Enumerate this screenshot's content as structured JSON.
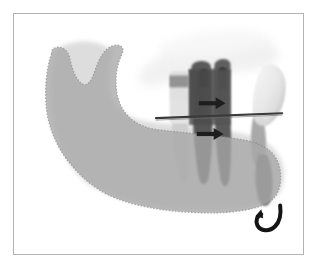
{
  "figure": {
    "caption": "",
    "frame": {
      "border_color": "#b3b3b3",
      "background_color": "#ffffff",
      "left": 13,
      "top": 13,
      "width": 291,
      "height": 242
    }
  },
  "colors": {
    "page_background": "#ffffff",
    "frame_border": "#b3b3b3",
    "mandible_overlay_fill": "#a8a8a8",
    "mandible_overlay_edge": "#8f8f8f",
    "radiograph_bone_light": "#d8d8d8",
    "radiograph_soft_tissue": "#efefef",
    "tooth_enamel_light": "#f2f2f2",
    "molar_dark": "#4a4a4a",
    "molar_mid": "#6e6e6e",
    "premolar_light": "#c9c9c9",
    "osteotomy_line": "#3a3a3a",
    "arrow_color": "#1e1e1e",
    "rotation_arrow_color": "#141414",
    "root_shadow_dark": "#5f5f5f"
  },
  "annotations": {
    "horizontal_line": {
      "name": "osteotomy-cut-line",
      "description": "Horizontal osteotomy reference line",
      "x1": 156,
      "y1": 117,
      "x2": 282,
      "y2": 112,
      "stroke_width": 2,
      "color": "#3a3a3a"
    },
    "arrows": [
      {
        "name": "advancement-arrow-upper",
        "direction": "right",
        "x": 198,
        "y": 103,
        "length": 22,
        "color": "#1e1e1e"
      },
      {
        "name": "advancement-arrow-lower",
        "direction": "right",
        "x": 196,
        "y": 133,
        "length": 22,
        "color": "#1e1e1e"
      }
    ],
    "rotation_arrow": {
      "name": "rotation-arrow",
      "direction": "counterclockwise-hook",
      "x": 270,
      "y": 225,
      "size": 20,
      "color": "#141414"
    }
  },
  "anatomy": {
    "mandible_overlay": {
      "name": "mandible-planned-position-overlay",
      "fill": "#a8a8a8",
      "edge_style": "stippled-dotted",
      "opacity": 0.78
    },
    "structures": [
      {
        "name": "condyle",
        "label": "Condyle"
      },
      {
        "name": "coronoid-process",
        "label": "Coronoid process"
      },
      {
        "name": "sigmoid-notch",
        "label": "Sigmoid notch"
      },
      {
        "name": "ramus",
        "label": "Ramus"
      },
      {
        "name": "gonial-angle",
        "label": "Gonial angle"
      },
      {
        "name": "mandibular-body",
        "label": "Body of mandible"
      },
      {
        "name": "symphysis",
        "label": "Symphysis"
      },
      {
        "name": "first-molar",
        "label": "First molar"
      },
      {
        "name": "second-molar",
        "label": "Second molar"
      },
      {
        "name": "premolar",
        "label": "Premolar"
      },
      {
        "name": "impacted-third-molar",
        "label": "Impacted third molar"
      },
      {
        "name": "maxillary-soft-tissue",
        "label": "Maxillary soft tissue shadow"
      }
    ]
  }
}
